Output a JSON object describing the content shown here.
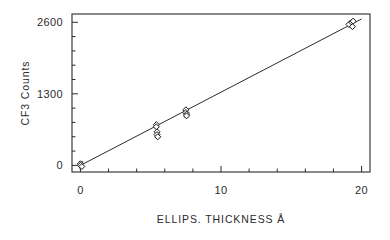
{
  "chart_data": {
    "type": "scatter",
    "title": "",
    "xlabel": "ELLIPS. THICKNESS Å",
    "ylabel": "CF3 Counts",
    "xlim": [
      -0.6,
      20.6
    ],
    "ylim": [
      -120,
      2750
    ],
    "xticks": [
      0,
      10,
      20
    ],
    "xticklabels": [
      "0",
      "10",
      "20"
    ],
    "yticks": [
      0,
      1300,
      2600
    ],
    "yticklabels": [
      "0",
      "1300",
      "2600"
    ],
    "x_minor_tick_interval": 2,
    "y_minor_tick_interval": 260,
    "grid": false,
    "legend": null,
    "frame": "box",
    "marker": "diamond",
    "marker_filled": false,
    "points": [
      {
        "x": 0.0,
        "y": 30
      },
      {
        "x": 0.0,
        "y": 0
      },
      {
        "x": 0.1,
        "y": -20
      },
      {
        "x": 5.4,
        "y": 740
      },
      {
        "x": 5.4,
        "y": 700
      },
      {
        "x": 5.45,
        "y": 610
      },
      {
        "x": 5.45,
        "y": 560
      },
      {
        "x": 5.5,
        "y": 520
      },
      {
        "x": 7.5,
        "y": 1010
      },
      {
        "x": 7.5,
        "y": 960
      },
      {
        "x": 7.55,
        "y": 930
      },
      {
        "x": 7.55,
        "y": 900
      },
      {
        "x": 19.1,
        "y": 2560
      },
      {
        "x": 19.3,
        "y": 2600
      },
      {
        "x": 19.4,
        "y": 2620
      },
      {
        "x": 19.35,
        "y": 2520
      }
    ],
    "error_bars": [
      {
        "x": 0.05,
        "y": 10,
        "yerr": 55
      },
      {
        "x": 5.45,
        "y": 620,
        "yerr": 115
      },
      {
        "x": 7.52,
        "y": 955,
        "yerr": 75
      },
      {
        "x": 19.3,
        "y": 2570,
        "yerr": 60
      }
    ],
    "fit_line": {
      "type": "linear",
      "x": [
        0.0,
        20.0
      ],
      "y": [
        0,
        2660
      ],
      "slope": 133,
      "intercept": 0
    },
    "colors": {
      "axis": "#2b2b2b",
      "marker_stroke": "#1a1a1a",
      "marker_fill": "#ffffff",
      "fit_line": "#2b2b2b",
      "background": "#ffffff"
    }
  }
}
